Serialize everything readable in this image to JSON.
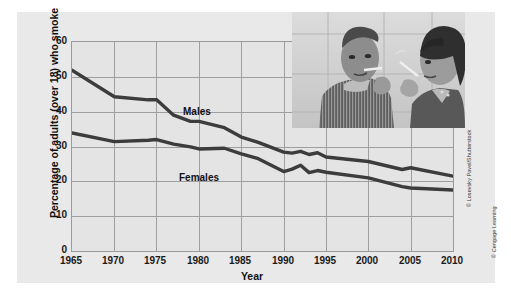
{
  "figure": {
    "background_color": "#e9e9e9",
    "plot_background_color": "#e4e4e4",
    "grid_color": "#9e9e9e",
    "line_color": "#3c3c3c"
  },
  "credits": {
    "photo": "© Losevsky Pavel/Shutterstock",
    "publisher": "© Cengage Learning"
  },
  "photo": {
    "alt": "Black and white photograph of a young man and a young woman smoking cigarettes"
  },
  "chart_data": {
    "type": "line",
    "title": "",
    "xlabel": "Year",
    "ylabel": "Percentage of adults (over 18) who smoke",
    "xlim": [
      1965,
      2010
    ],
    "ylim": [
      0,
      60
    ],
    "xticks": [
      1965,
      1970,
      1975,
      1980,
      1985,
      1990,
      1995,
      2000,
      2005,
      2010
    ],
    "yticks": [
      0,
      10,
      20,
      30,
      40,
      50,
      60
    ],
    "grid": true,
    "legend": "inline-labels",
    "series": [
      {
        "name": "Males",
        "label": "Males",
        "x": [
          1965,
          1970,
          1974,
          1975,
          1977,
          1979,
          1980,
          1983,
          1985,
          1987,
          1990,
          1991,
          1992,
          1993,
          1994,
          1995,
          2000,
          2004,
          2005,
          2010
        ],
        "values": [
          51.9,
          44.3,
          43.4,
          43.4,
          39.0,
          37.2,
          37.2,
          35.4,
          32.7,
          31.2,
          28.4,
          28.1,
          28.6,
          27.7,
          28.2,
          27.0,
          25.7,
          23.4,
          23.9,
          21.5
        ]
      },
      {
        "name": "Females",
        "label": "Females",
        "x": [
          1965,
          1970,
          1974,
          1975,
          1977,
          1979,
          1980,
          1983,
          1985,
          1987,
          1990,
          1991,
          1992,
          1993,
          1994,
          1995,
          2000,
          2004,
          2005,
          2010
        ],
        "values": [
          33.9,
          31.4,
          31.8,
          32.0,
          30.7,
          29.9,
          29.3,
          29.5,
          27.9,
          26.5,
          22.8,
          23.5,
          24.6,
          22.5,
          23.1,
          22.6,
          21.0,
          18.5,
          18.1,
          17.5
        ]
      }
    ]
  }
}
